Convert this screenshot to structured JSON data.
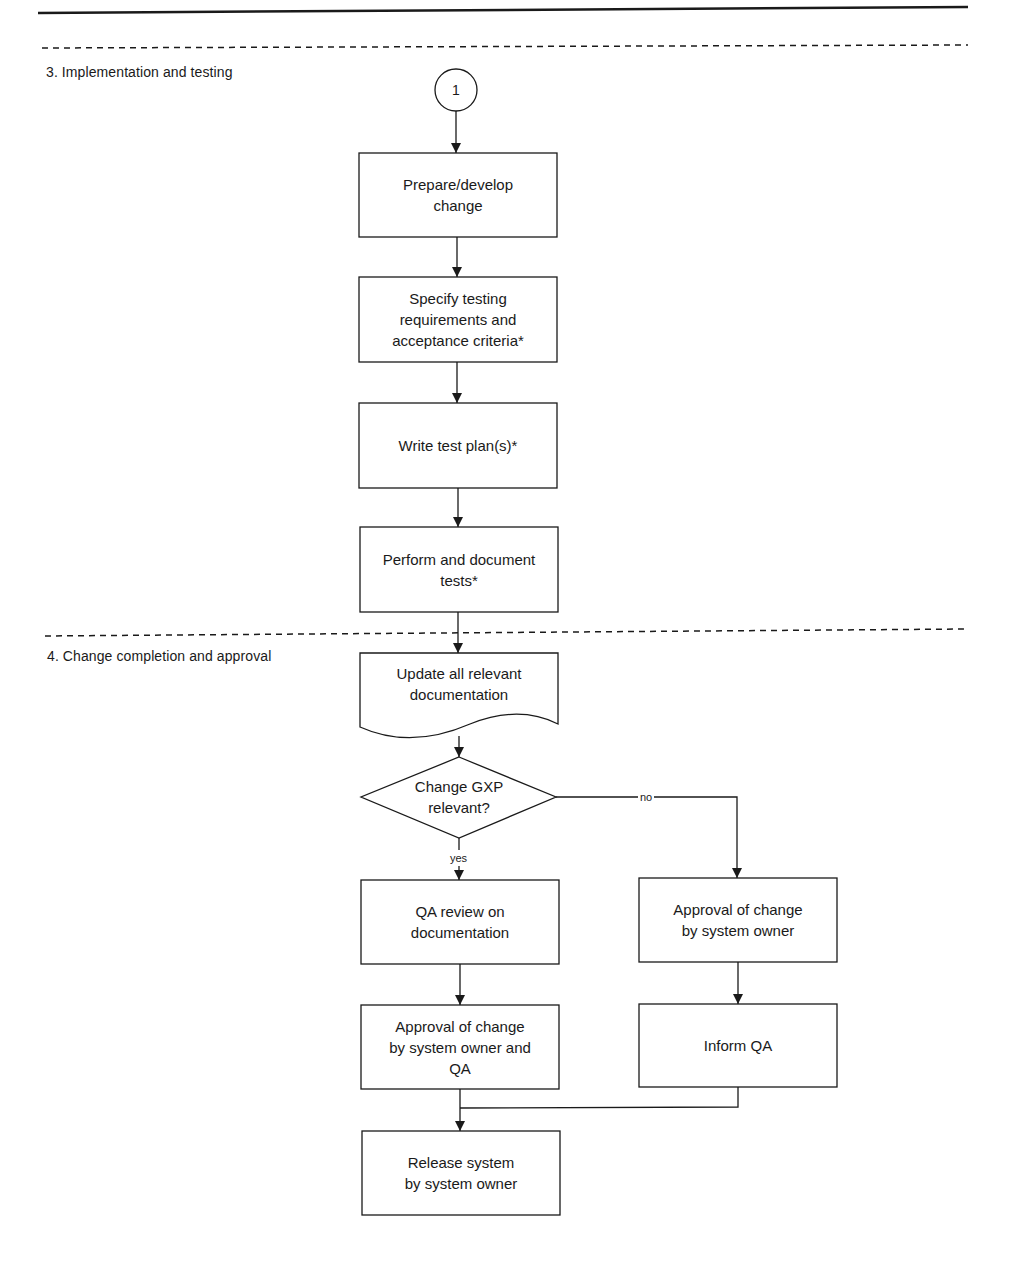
{
  "colors": {
    "ink": "#1a1a1a",
    "background": "#ffffff"
  },
  "sections": [
    {
      "id": "s3",
      "label": "3. Implementation and testing"
    },
    {
      "id": "s4",
      "label": "4. Change completion and approval"
    }
  ],
  "connector": {
    "label": "1",
    "shape": "circle"
  },
  "nodes": {
    "prepare": {
      "shape": "process",
      "text": "Prepare/develop\nchange"
    },
    "specify": {
      "shape": "process",
      "text": "Specify testing\nrequirements and\nacceptance criteria*"
    },
    "write_plan": {
      "shape": "process",
      "text": "Write test plan(s)*"
    },
    "perform_tests": {
      "shape": "process",
      "text": "Perform and document\ntests*"
    },
    "update_docs": {
      "shape": "document",
      "text": "Update all relevant\ndocumentation"
    },
    "gxp_decision": {
      "shape": "decision",
      "text": "Change GXP\nrelevant?"
    },
    "qa_review": {
      "shape": "process",
      "text": "QA review on\ndocumentation"
    },
    "approval_owner_qa": {
      "shape": "process",
      "text": "Approval of change\nby system owner and\nQA"
    },
    "approval_owner": {
      "shape": "process",
      "text": "Approval of change\nby system owner"
    },
    "inform_qa": {
      "shape": "process",
      "text": "Inform QA"
    },
    "release": {
      "shape": "process",
      "text": "Release system\nby system owner"
    }
  },
  "edges": {
    "yes_label": "yes",
    "no_label": "no"
  },
  "flow": [
    [
      "connector",
      "prepare"
    ],
    [
      "prepare",
      "specify"
    ],
    [
      "specify",
      "write_plan"
    ],
    [
      "write_plan",
      "perform_tests"
    ],
    [
      "perform_tests",
      "update_docs"
    ],
    [
      "update_docs",
      "gxp_decision"
    ],
    [
      "gxp_decision",
      "qa_review",
      "yes"
    ],
    [
      "gxp_decision",
      "approval_owner",
      "no"
    ],
    [
      "qa_review",
      "approval_owner_qa"
    ],
    [
      "approval_owner",
      "inform_qa"
    ],
    [
      "approval_owner_qa",
      "release"
    ],
    [
      "inform_qa",
      "release"
    ]
  ]
}
